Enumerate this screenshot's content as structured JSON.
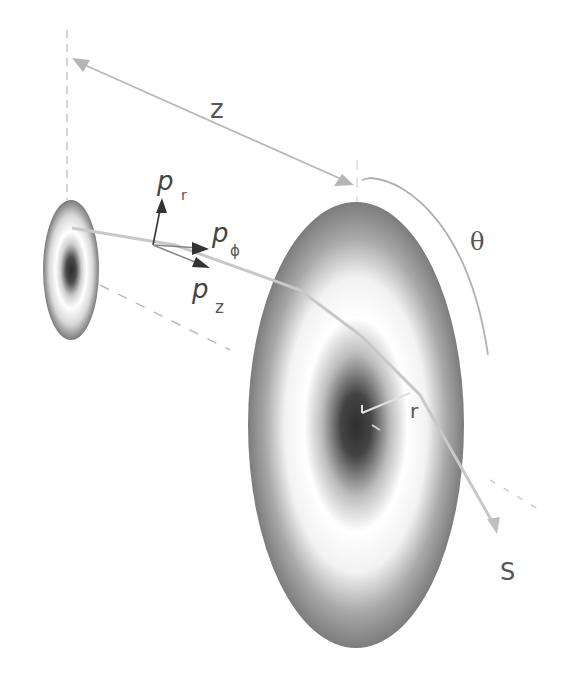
{
  "diagram": {
    "labels": {
      "distance": "z",
      "angle": "θ",
      "momentum_r_base": "p",
      "momentum_r_sub": "r",
      "momentum_phi_base": "p",
      "momentum_phi_sub": "ϕ",
      "momentum_z_base": "p",
      "momentum_z_sub": "z",
      "radius": "r",
      "screen": "S"
    },
    "colors": {
      "background": "#ffffff",
      "ring_dark": "#555555",
      "ring_light": "#ffffff",
      "arrow_light": "#b0b0b0",
      "arrow_dark": "#333333",
      "text": "#555555"
    }
  }
}
